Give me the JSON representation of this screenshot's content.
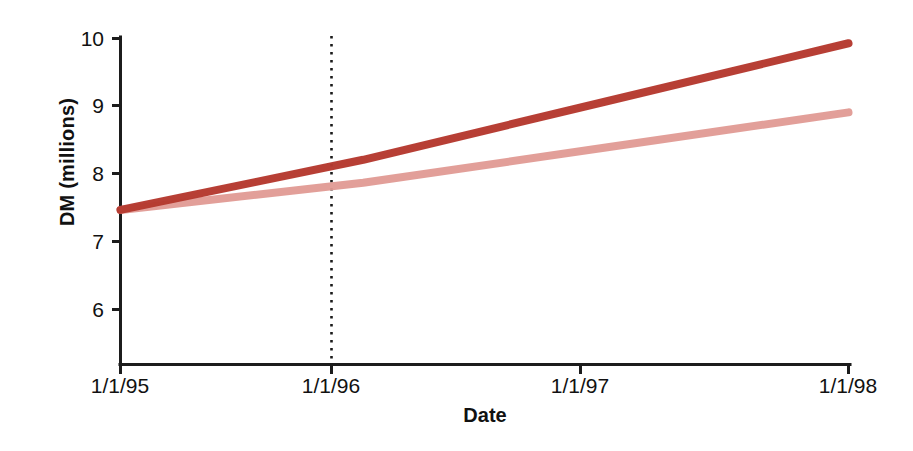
{
  "chart_data": {
    "type": "line",
    "title": "",
    "subtitle": "",
    "xlabel": "Date",
    "ylabel": "DM (millions)",
    "x": [
      "1/1/95",
      "1/1/96",
      "1/1/97",
      "1/1/98"
    ],
    "categories": [
      "1/1/95",
      "1/1/96",
      "1/1/97",
      "1/1/98"
    ],
    "xtick_labels": [
      "1/1/95",
      "1/1/96",
      "1/1/97",
      "1/1/98"
    ],
    "ytick_labels": [
      "10",
      "9",
      "8",
      "7",
      "6"
    ],
    "ytick_values": [
      10,
      9,
      8,
      7,
      6
    ],
    "ylim": [
      5.3,
      10.0
    ],
    "xlim": [
      "1/1/95",
      "1/1/98"
    ],
    "grid": false,
    "legend": "none",
    "series": [
      {
        "name": "upper-line",
        "color": "#b5392f",
        "values": [
          7.47,
          8.21,
          9.07,
          9.93
        ]
      },
      {
        "name": "lower-line",
        "color": "#e09a93",
        "values": [
          7.47,
          7.87,
          8.39,
          8.91
        ]
      }
    ],
    "annotations": [
      {
        "name": "reference-line",
        "type": "vertical-dotted-line",
        "x": "1/1/96",
        "color": "#1a1a1a"
      }
    ]
  },
  "axes": {
    "y": {
      "label": "DM (millions)",
      "ticks": [
        {
          "label": "10",
          "value": 10
        },
        {
          "label": "9",
          "value": 9
        },
        {
          "label": "8",
          "value": 8
        },
        {
          "label": "7",
          "value": 7
        },
        {
          "label": "6",
          "value": 6
        }
      ]
    },
    "x": {
      "label": "Date",
      "ticks": [
        {
          "label": "1/1/95"
        },
        {
          "label": "1/1/96"
        },
        {
          "label": "1/1/97"
        },
        {
          "label": "1/1/98"
        }
      ]
    }
  },
  "colors": {
    "axis": "#1a1a1a",
    "text": "#111111",
    "series_dark": "#b5392f",
    "series_light": "#e09a93",
    "background": "#ffffff"
  }
}
